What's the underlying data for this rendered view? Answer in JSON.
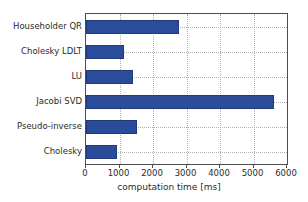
{
  "chart_data": {
    "type": "bar",
    "orientation": "horizontal",
    "title": "",
    "xlabel": "computation time [ms]",
    "ylabel": "",
    "xlim": [
      0,
      6000
    ],
    "xticks": [
      0,
      1000,
      2000,
      3000,
      4000,
      5000,
      6000
    ],
    "xtick_labels": [
      "0",
      "1000",
      "2000",
      "3000",
      "4000",
      "5000",
      "6000"
    ],
    "grid": true,
    "grid_style": "dotted",
    "legend": null,
    "bar_color": "#2b4b9b",
    "categories": [
      "Householder QR",
      "Cholesky LDLT",
      "LU",
      "Jacobi SVD",
      "Pseudo-inverse",
      "Cholesky"
    ],
    "values": [
      2780,
      1120,
      1390,
      5615,
      1510,
      915
    ]
  }
}
